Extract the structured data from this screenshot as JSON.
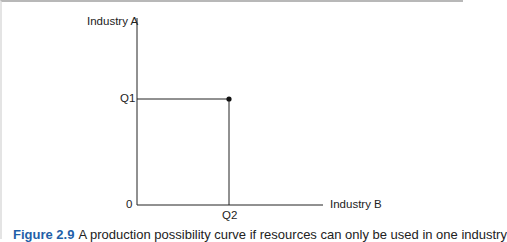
{
  "diagram": {
    "title": "Production possibility curve",
    "y_axis_label": "Industry A",
    "x_axis_label": "Industry B",
    "origin_label": "0",
    "y_tick_label": "Q1",
    "x_tick_label": "Q2",
    "point": {
      "x_label": "Q2",
      "y_label": "Q1"
    },
    "colors": {
      "line": "#222222",
      "caption_figure": "#1f5fa8"
    }
  },
  "caption": {
    "figure_number": "Figure 2.9",
    "text": "A production possibility curve if resources can only be used in one industry"
  }
}
